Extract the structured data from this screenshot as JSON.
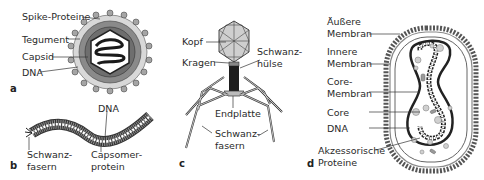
{
  "figure": {
    "panels": [
      {
        "id": "a",
        "letter": "a",
        "labels": [
          "Spike-Proteine",
          "Tegument",
          "Capsid",
          "DNA"
        ]
      },
      {
        "id": "b",
        "letter": "b",
        "labels": {
          "dna": "DNA",
          "schwanzfasern_1": "Schwanz-",
          "schwanzfasern_2": "fasern",
          "capsomer_1": "Capsomer-",
          "capsomer_2": "protein"
        }
      },
      {
        "id": "c",
        "letter": "c",
        "labels": {
          "kopf": "Kopf",
          "kragen": "Kragen",
          "schwanzhuelse_1": "Schwanz-",
          "schwanzhuelse_2": "hülse",
          "endplatte": "Endplatte",
          "schwanzfasern_1": "Schwanz-",
          "schwanzfasern_2": "fasern"
        }
      },
      {
        "id": "d",
        "letter": "d",
        "labels": {
          "aeussere_1": "Äußere",
          "aeussere_2": "Membran",
          "innere_1": "Innere",
          "innere_2": "Membran",
          "core_membran_1": "Core-",
          "core_membran_2": "Membran",
          "core": "Core",
          "dna": "DNA",
          "akzessorische_1": "Akzessorische",
          "akzessorische_2": "Proteine"
        }
      }
    ],
    "colors": {
      "line": "#333333",
      "fill_gray": "#bdbdbd",
      "fill_dark": "#2b2b2b",
      "background": "#ffffff"
    }
  }
}
